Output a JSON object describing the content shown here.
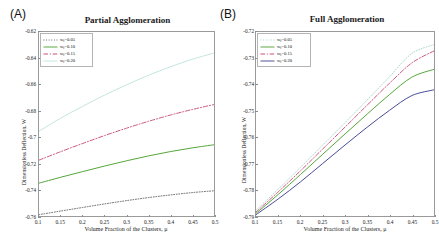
{
  "figure": {
    "panels": [
      {
        "letter": "(A)",
        "title": "Partial Agglomeration",
        "xlabel": "Volume Fraction of the Clusters, μ",
        "ylabel": "Dimensionless Deflection, W",
        "yticks": [
          "-0.62",
          "-0.64",
          "-0.66",
          "-0.68",
          "-0.7",
          "-0.72",
          "-0.74",
          "-0.76"
        ],
        "xticks": [
          "0.1",
          "0.15",
          "0.2",
          "0.25",
          "0.3",
          "0.35",
          "0.4",
          "0.45",
          "0.5"
        ],
        "legend": [
          {
            "label_prefix": "w",
            "label_sub": "f",
            "label_suffix": " =0.05",
            "style": "dotted",
            "color": "#4a4a4a"
          },
          {
            "label_prefix": "w",
            "label_sub": "f",
            "label_suffix": " =0.10",
            "style": "solid",
            "color": "#4aa02c"
          },
          {
            "label_prefix": "w",
            "label_sub": "f",
            "label_suffix": " =0.15",
            "style": "dashdot",
            "color": "#c23b6e"
          },
          {
            "label_prefix": "w",
            "label_sub": "f",
            "label_suffix": " =0.20",
            "style": "solid",
            "color": "#bfe3dd"
          }
        ]
      },
      {
        "letter": "(B)",
        "title": "Full Agglomeration",
        "xlabel": "Volume Fraction of the Clusters, μ",
        "ylabel": "Dimensionless Deflection, W",
        "yticks": [
          "-0.72",
          "-0.73",
          "-0.74",
          "-0.75",
          "-0.76",
          "-0.77",
          "-0.78",
          "-0.79"
        ],
        "xticks": [
          "0.1",
          "0.15",
          "0.2",
          "0.25",
          "0.3",
          "0.35",
          "0.4",
          "0.45",
          "0.5"
        ],
        "legend": [
          {
            "label_prefix": "w",
            "label_sub": "f",
            "label_suffix": " =0.05",
            "style": "dotted",
            "color": "#9ccfc6"
          },
          {
            "label_prefix": "w",
            "label_sub": "f",
            "label_suffix": " =0.10",
            "style": "solid",
            "color": "#4aa02c"
          },
          {
            "label_prefix": "w",
            "label_sub": "f",
            "label_suffix": " =0.15",
            "style": "dashdot",
            "color": "#c23b6e"
          },
          {
            "label_prefix": "w",
            "label_sub": "f",
            "label_suffix": " =0.20",
            "style": "solid",
            "color": "#3b3f8f"
          }
        ]
      }
    ]
  },
  "chart_data": [
    {
      "type": "line",
      "title": "Partial Agglomeration",
      "panel": "(A)",
      "xlabel": "Volume Fraction of the Clusters, μ",
      "ylabel": "Dimensionless Deflection, W",
      "xlim": [
        0.1,
        0.5
      ],
      "ylim": [
        -0.76,
        -0.62
      ],
      "xticks": [
        0.1,
        0.15,
        0.2,
        0.25,
        0.3,
        0.35,
        0.4,
        0.45,
        0.5
      ],
      "yticks": [
        -0.62,
        -0.64,
        -0.66,
        -0.68,
        -0.7,
        -0.72,
        -0.74,
        -0.76
      ],
      "grid": false,
      "legend_position": "upper-left",
      "x": [
        0.1,
        0.15,
        0.2,
        0.25,
        0.3,
        0.35,
        0.4,
        0.45,
        0.5
      ],
      "series": [
        {
          "name": "w_f =0.20",
          "style": "solid",
          "color": "#bfe3dd",
          "values": [
            -0.6955,
            -0.6855,
            -0.6765,
            -0.668,
            -0.6602,
            -0.653,
            -0.6465,
            -0.6408,
            -0.636
          ]
        },
        {
          "name": "w_f =0.15",
          "style": "dashdot",
          "color": "#c23b6e",
          "values": [
            -0.7175,
            -0.711,
            -0.7048,
            -0.6988,
            -0.6932,
            -0.688,
            -0.6832,
            -0.679,
            -0.6752
          ]
        },
        {
          "name": "w_f =0.10",
          "style": "solid",
          "color": "#4aa02c",
          "values": [
            -0.735,
            -0.7305,
            -0.7262,
            -0.722,
            -0.718,
            -0.7143,
            -0.711,
            -0.7082,
            -0.7058
          ]
        },
        {
          "name": "w_f =0.05",
          "style": "dotted",
          "color": "#4a4a4a",
          "values": [
            -0.759,
            -0.7562,
            -0.7535,
            -0.7508,
            -0.7483,
            -0.746,
            -0.744,
            -0.7422,
            -0.7408
          ]
        }
      ]
    },
    {
      "type": "line",
      "title": "Full Agglomeration",
      "panel": "(B)",
      "xlabel": "Volume Fraction of the Clusters, μ",
      "ylabel": "Dimensionless Deflection, W",
      "xlim": [
        0.1,
        0.5
      ],
      "ylim": [
        -0.79,
        -0.72
      ],
      "xticks": [
        0.1,
        0.15,
        0.2,
        0.25,
        0.3,
        0.35,
        0.4,
        0.45,
        0.5
      ],
      "yticks": [
        -0.72,
        -0.73,
        -0.74,
        -0.75,
        -0.76,
        -0.77,
        -0.78,
        -0.79
      ],
      "grid": false,
      "legend_position": "upper-left",
      "x": [
        0.1,
        0.15,
        0.2,
        0.25,
        0.3,
        0.35,
        0.4,
        0.45,
        0.5
      ],
      "series": [
        {
          "name": "w_f =0.05",
          "style": "dotted",
          "color": "#9ccfc6",
          "values": [
            -0.7878,
            -0.7798,
            -0.7715,
            -0.763,
            -0.7545,
            -0.7458,
            -0.737,
            -0.7282,
            -0.7248
          ]
        },
        {
          "name": "w_f =0.15",
          "style": "dashdot",
          "color": "#c23b6e",
          "values": [
            -0.7885,
            -0.7808,
            -0.7728,
            -0.7645,
            -0.7562,
            -0.7478,
            -0.7395,
            -0.7318,
            -0.7272
          ]
        },
        {
          "name": "w_f =0.10",
          "style": "solid",
          "color": "#4aa02c",
          "values": [
            -0.789,
            -0.7818,
            -0.7742,
            -0.7665,
            -0.7588,
            -0.7512,
            -0.7438,
            -0.7372,
            -0.7342
          ]
        },
        {
          "name": "w_f =0.20",
          "style": "solid",
          "color": "#3b3f8f",
          "values": [
            -0.7895,
            -0.7835,
            -0.777,
            -0.77,
            -0.763,
            -0.7562,
            -0.7498,
            -0.7442,
            -0.742
          ]
        }
      ]
    }
  ]
}
